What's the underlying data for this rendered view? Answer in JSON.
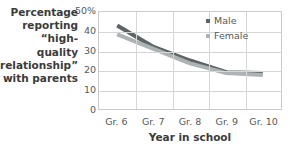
{
  "chart_data": {
    "type": "line",
    "title": "",
    "subtitle": "",
    "xlabel": "Year in school",
    "ylabel": "Percentage reporting “high-quality relationship” with parents",
    "categories": [
      "Gr. 6",
      "Gr. 7",
      "Gr. 8",
      "Gr. 9",
      "Gr. 10"
    ],
    "series": [
      {
        "name": "Male",
        "values": [
          43,
          32,
          25,
          19,
          18.5
        ],
        "color": "#5e6366"
      },
      {
        "name": "Female",
        "values": [
          38.5,
          31,
          23.5,
          18.5,
          17.5
        ],
        "color": "#adb2b4"
      }
    ],
    "ylim": [
      0,
      50
    ],
    "ytick_values": [
      50,
      40,
      30,
      20,
      10,
      0
    ],
    "ytick_labels": [
      "50%",
      "40",
      "30",
      "20",
      "10",
      "0"
    ],
    "grid": true,
    "legend_position": "top-right",
    "axis_line_color": "#c9cccd",
    "grid_color": "#d4d7d8",
    "text_color": "#54595b"
  },
  "axis_titles": {
    "y": "Percentage\nreporting\n“high-quality\nrelationship”\nwith parents",
    "x": "Year in school"
  }
}
